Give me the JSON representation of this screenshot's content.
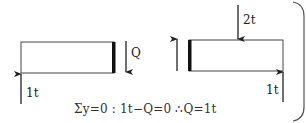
{
  "figure": {
    "type": "free-body diagram of beam section (shear force)",
    "left_segment": {
      "reaction_label": "1t",
      "shear_label": "Q",
      "shear_direction": "down",
      "reaction_direction": "up"
    },
    "right_segment": {
      "point_load_label": "2t",
      "point_load_direction": "down",
      "reaction_label": "1t",
      "reaction_direction": "up",
      "shear_direction": "up"
    },
    "equation": "Σy=0 : 1t−Q=0  ∴Q=1t"
  },
  "colors": {
    "line": "#333333",
    "thick_bar": "#111111",
    "frame": "#555555",
    "background": "#ffffff"
  }
}
